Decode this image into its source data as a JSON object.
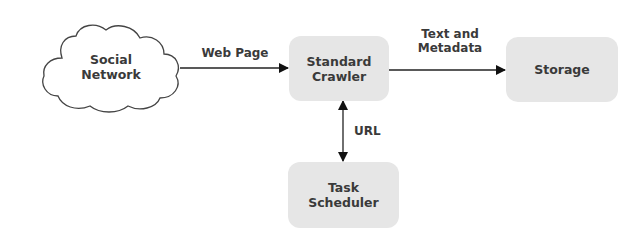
{
  "diagram": {
    "nodes": {
      "social_network": {
        "line1": "Social",
        "line2": "Network",
        "shape": "cloud"
      },
      "standard_crawler": {
        "line1": "Standard",
        "line2": "Crawler",
        "shape": "rounded-rect"
      },
      "storage": {
        "line1": "Storage",
        "shape": "rounded-rect"
      },
      "task_scheduler": {
        "line1": "Task",
        "line2": "Scheduler",
        "shape": "rounded-rect"
      }
    },
    "edges": {
      "web_page": {
        "label": "Web Page",
        "from": "Social Network",
        "to": "Standard Crawler"
      },
      "text_metadata": {
        "line1": "Text and",
        "line2": "Metadata",
        "from": "Standard Crawler",
        "to": "Storage"
      },
      "url": {
        "label": "URL",
        "between": [
          "Standard Crawler",
          "Task Scheduler"
        ],
        "bidirectional": true
      }
    },
    "colors": {
      "box_fill": "#e6e6e6",
      "text": "#3a3a3a",
      "line": "#222222"
    }
  }
}
